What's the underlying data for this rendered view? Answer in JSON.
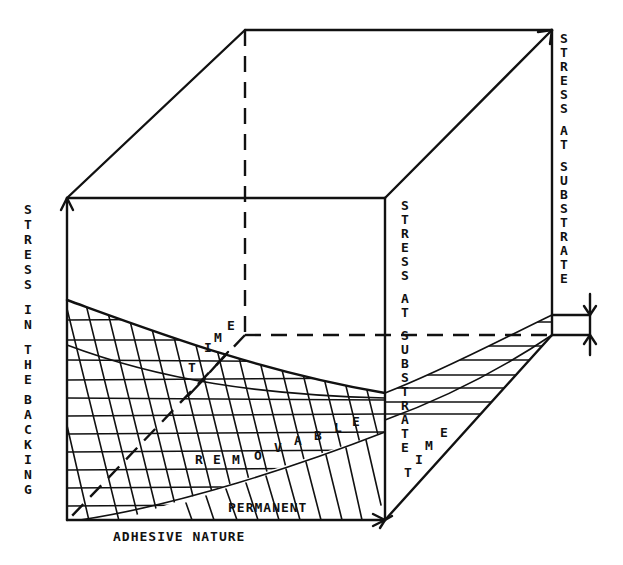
{
  "diagram": {
    "axis_labels": {
      "left_vertical": "STRESS IN THE BACKING",
      "right_back_vertical": "STRESS AT SUBSTRATE",
      "right_front_vertical": "STRESS AT SUBSTRATE",
      "bottom": "ADHESIVE NATURE"
    },
    "left_vertical_letters": [
      "S",
      "T",
      "R",
      "E",
      "S",
      "S",
      "",
      "I",
      "N",
      "",
      "T",
      "H",
      "E",
      "",
      "B",
      "A",
      "C",
      "K",
      "I",
      "N",
      "G"
    ],
    "back_vertical_letters": [
      "S",
      "T",
      "R",
      "E",
      "S",
      "S",
      "",
      "A",
      "T",
      "",
      "S",
      "U",
      "B",
      "S",
      "T",
      "R",
      "A",
      "T",
      "E"
    ],
    "front_vertical_letters": [
      "S",
      "T",
      "R",
      "E",
      "S",
      "S",
      "",
      "A",
      "T",
      "",
      "S",
      "U",
      "B",
      "S",
      "T",
      "R",
      "A",
      "T",
      "E"
    ],
    "region_labels": {
      "removable": "REMOVABLE",
      "permanent": "PERMANENT"
    },
    "removable_letters": [
      "R",
      "E",
      "M",
      "O",
      "V",
      "A",
      "B",
      "L",
      "E"
    ],
    "time_axis_left": [
      "T",
      "I",
      "M",
      "E"
    ],
    "time_axis_right": [
      "T",
      "I",
      "M",
      "E"
    ],
    "colors": {
      "ink": "#111111",
      "background": "#ffffff"
    }
  }
}
